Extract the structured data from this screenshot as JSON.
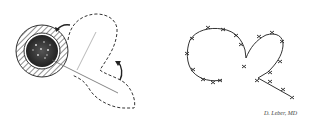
{
  "figure": {
    "left_panel": {
      "description": "Defect with rotation flap outlined (dashed) and rotation arrows",
      "elements": [
        "circular-defect",
        "hatched-ring",
        "dashed-flap-outline",
        "rotation-arrow-top",
        "rotation-arrow-right",
        "incision-line"
      ]
    },
    "right_panel": {
      "description": "Closed flap with interrupted sutures",
      "elements": [
        "sutured-closure-left-loop",
        "sutured-closure-right-loop",
        "suture-marks"
      ]
    },
    "signature": "D. Leber, MD",
    "colors": {
      "ink": "#333333",
      "background": "#ffffff"
    }
  }
}
